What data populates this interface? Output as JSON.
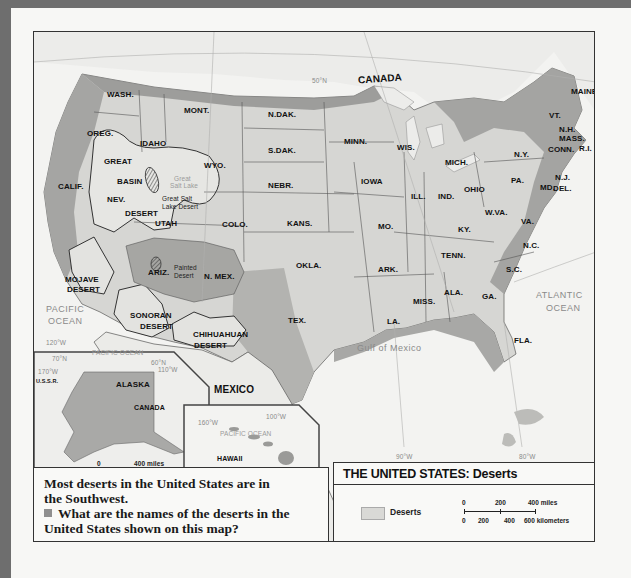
{
  "map": {
    "title": "THE UNITED STATES: Deserts",
    "countries": [
      "CANADA",
      "MEXICO"
    ],
    "states": [
      {
        "label": "WASH.",
        "x": 73,
        "y": 58
      },
      {
        "label": "OREG.",
        "x": 53,
        "y": 97
      },
      {
        "label": "CALIF.",
        "x": 24,
        "y": 150
      },
      {
        "label": "IDAHO",
        "x": 106,
        "y": 107
      },
      {
        "label": "NEV.",
        "x": 73,
        "y": 163
      },
      {
        "label": "MONT.",
        "x": 150,
        "y": 74
      },
      {
        "label": "WYO.",
        "x": 170,
        "y": 129
      },
      {
        "label": "UTAH",
        "x": 121,
        "y": 187
      },
      {
        "label": "COLO.",
        "x": 188,
        "y": 188
      },
      {
        "label": "ARIZ.",
        "x": 114,
        "y": 236
      },
      {
        "label": "N. MEX.",
        "x": 170,
        "y": 240
      },
      {
        "label": "N.DAK.",
        "x": 234,
        "y": 78
      },
      {
        "label": "S.DAK.",
        "x": 234,
        "y": 114
      },
      {
        "label": "NEBR.",
        "x": 234,
        "y": 149
      },
      {
        "label": "KANS.",
        "x": 253,
        "y": 187
      },
      {
        "label": "OKLA.",
        "x": 262,
        "y": 229
      },
      {
        "label": "TEX.",
        "x": 254,
        "y": 284
      },
      {
        "label": "MINN.",
        "x": 310,
        "y": 105
      },
      {
        "label": "IOWA",
        "x": 327,
        "y": 145
      },
      {
        "label": "MO.",
        "x": 344,
        "y": 190
      },
      {
        "label": "ARK.",
        "x": 344,
        "y": 233
      },
      {
        "label": "LA.",
        "x": 353,
        "y": 285
      },
      {
        "label": "WIS.",
        "x": 363,
        "y": 111
      },
      {
        "label": "ILL.",
        "x": 377,
        "y": 160
      },
      {
        "label": "MISS.",
        "x": 379,
        "y": 265
      },
      {
        "label": "MICH.",
        "x": 411,
        "y": 126
      },
      {
        "label": "IND.",
        "x": 404,
        "y": 160
      },
      {
        "label": "OHIO",
        "x": 430,
        "y": 153
      },
      {
        "label": "KY.",
        "x": 424,
        "y": 193
      },
      {
        "label": "TENN.",
        "x": 407,
        "y": 219
      },
      {
        "label": "ALA.",
        "x": 410,
        "y": 256
      },
      {
        "label": "GA.",
        "x": 448,
        "y": 260
      },
      {
        "label": "W.VA.",
        "x": 451,
        "y": 176
      },
      {
        "label": "VA.",
        "x": 487,
        "y": 185
      },
      {
        "label": "N.C.",
        "x": 489,
        "y": 209
      },
      {
        "label": "S.C.",
        "x": 472,
        "y": 233
      },
      {
        "label": "FLA.",
        "x": 480,
        "y": 304
      },
      {
        "label": "PA.",
        "x": 477,
        "y": 144
      },
      {
        "label": "N.Y.",
        "x": 480,
        "y": 118
      },
      {
        "label": "N.J.",
        "x": 521,
        "y": 141
      },
      {
        "label": "MD.",
        "x": 506,
        "y": 151
      },
      {
        "label": "DEL.",
        "x": 519,
        "y": 152
      },
      {
        "label": "VT.",
        "x": 515,
        "y": 79
      },
      {
        "label": "N.H.",
        "x": 525,
        "y": 93
      },
      {
        "label": "MASS.",
        "x": 525,
        "y": 102
      },
      {
        "label": "CONN.",
        "x": 514,
        "y": 113
      },
      {
        "label": "R.I.",
        "x": 545,
        "y": 112
      },
      {
        "label": "MAINE",
        "x": 537,
        "y": 55
      }
    ],
    "deserts": [
      {
        "label": "GREAT",
        "x": 70,
        "y": 125
      },
      {
        "label": "BASIN",
        "x": 83,
        "y": 145
      },
      {
        "label": "DESERT",
        "x": 91,
        "y": 177
      },
      {
        "label": "MOJAVE",
        "x": 31,
        "y": 243
      },
      {
        "label": "DESERT",
        "x": 33,
        "y": 253
      },
      {
        "label": "SONORAN",
        "x": 96,
        "y": 279
      },
      {
        "label": "DESERT",
        "x": 106,
        "y": 290
      },
      {
        "label": "CHIHUAHUAN",
        "x": 159,
        "y": 298
      },
      {
        "label": "DESERT",
        "x": 160,
        "y": 309
      }
    ],
    "desert_small_labels": [
      {
        "label": "Great Salt",
        "x": 128,
        "y": 163
      },
      {
        "label": "Lake Desert",
        "x": 128,
        "y": 171
      },
      {
        "label": "Painted",
        "x": 140,
        "y": 232
      },
      {
        "label": "Desert",
        "x": 140,
        "y": 240
      }
    ],
    "lake_labels": [
      {
        "label": "Great",
        "x": 140,
        "y": 143
      },
      {
        "label": "Salt Lake",
        "x": 136,
        "y": 150
      }
    ],
    "oceans": [
      {
        "label": "PACIFIC",
        "x": 12,
        "y": 272
      },
      {
        "label": "OCEAN",
        "x": 14,
        "y": 284
      },
      {
        "label": "ATLANTIC",
        "x": 502,
        "y": 258
      },
      {
        "label": "OCEAN",
        "x": 512,
        "y": 271
      },
      {
        "label": "Gulf of Mexico",
        "x": 323,
        "y": 311
      }
    ],
    "gridlines": [
      {
        "label": "50°N",
        "x": 278,
        "y": 45
      },
      {
        "label": "120°W",
        "x": 12,
        "y": 307
      },
      {
        "label": "90°W",
        "x": 362,
        "y": 421
      },
      {
        "label": "80°W",
        "x": 485,
        "y": 421
      },
      {
        "label": "100°W",
        "x": 232,
        "y": 381
      }
    ],
    "alaska_inset": {
      "label": "ALASKA",
      "country_label": "CANADA",
      "neighbor": "U.S.S.R.",
      "ocean": "PACIFIC OCEAN",
      "grid": [
        "70°N",
        "170°W",
        "60°N",
        "110°W",
        "160°W",
        "150°W",
        "140°W"
      ],
      "scale_miles": "400 miles",
      "scale_km": "400 kilometers",
      "scale_zero": "0"
    },
    "hawaii_inset": {
      "label": "HAWAII",
      "ocean": "PACIFIC OCEAN",
      "grid": [
        "160°W",
        "20°N",
        "155°W"
      ],
      "scale_miles": "200 miles",
      "scale_km": "200 kilometers",
      "scale_zero": "0"
    },
    "mexico_label": "MEXICO"
  },
  "caption": {
    "statement": "Most deserts in the United States are in the Southwest.",
    "question": "What are the names of the deserts in the United States shown on this map?"
  },
  "legend": {
    "title": "THE UNITED STATES: Deserts",
    "swatch_label": "Deserts",
    "scale": {
      "miles_ticks": [
        "0",
        "200",
        "400 miles"
      ],
      "km_ticks": [
        "0",
        "200",
        "400",
        "600 kilometers"
      ]
    }
  },
  "colors": {
    "land_light": "#e6e6e3",
    "land_dark": "#9c9c9a",
    "desert": "#dededb",
    "water": "#f4f4f2",
    "border_frame": "#6e6e6e"
  }
}
